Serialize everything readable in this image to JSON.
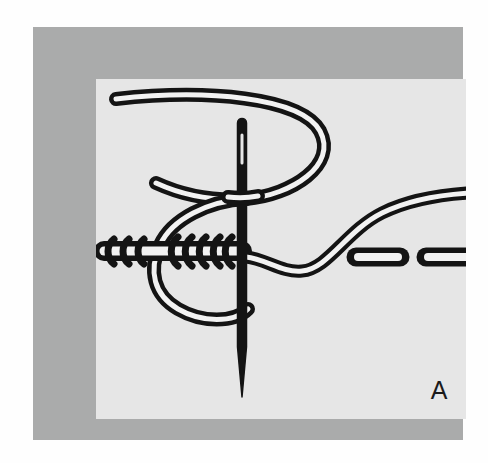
{
  "figure": {
    "label": "A",
    "colors": {
      "page_background": "#fefefe",
      "frame_border": "#aaabab",
      "panel_background": "#e6e6e6",
      "ink": "#141414",
      "thread_highlight": "#f2f2f2"
    },
    "geometry": {
      "canvas_width": 488,
      "canvas_height": 463,
      "frame_left": 33,
      "frame_top": 27,
      "frame_width": 430,
      "frame_height": 413,
      "panel_left": 63,
      "panel_top": 52,
      "panel_width": 370,
      "panel_height": 340
    }
  },
  "elements": {
    "needle": {
      "name": "sewing-needle",
      "top_y": 40,
      "point_y": 318,
      "x": 146,
      "shaft_width": 9,
      "eye_label": "needle-eye"
    },
    "thread": {
      "name": "embroidery-thread",
      "style": "double-outline",
      "stroke_width": 13,
      "highlight_width": 5
    },
    "coils": {
      "name": "wrapped-coil-stitches",
      "left_group_count": 3,
      "right_group_count": 6,
      "baseline_y": 172
    },
    "running_stitches": {
      "name": "running-stitch-dashes",
      "count": 2,
      "y": 178,
      "dashes": [
        {
          "x": 254,
          "width": 56
        },
        {
          "x": 324,
          "width": 56
        }
      ]
    }
  }
}
